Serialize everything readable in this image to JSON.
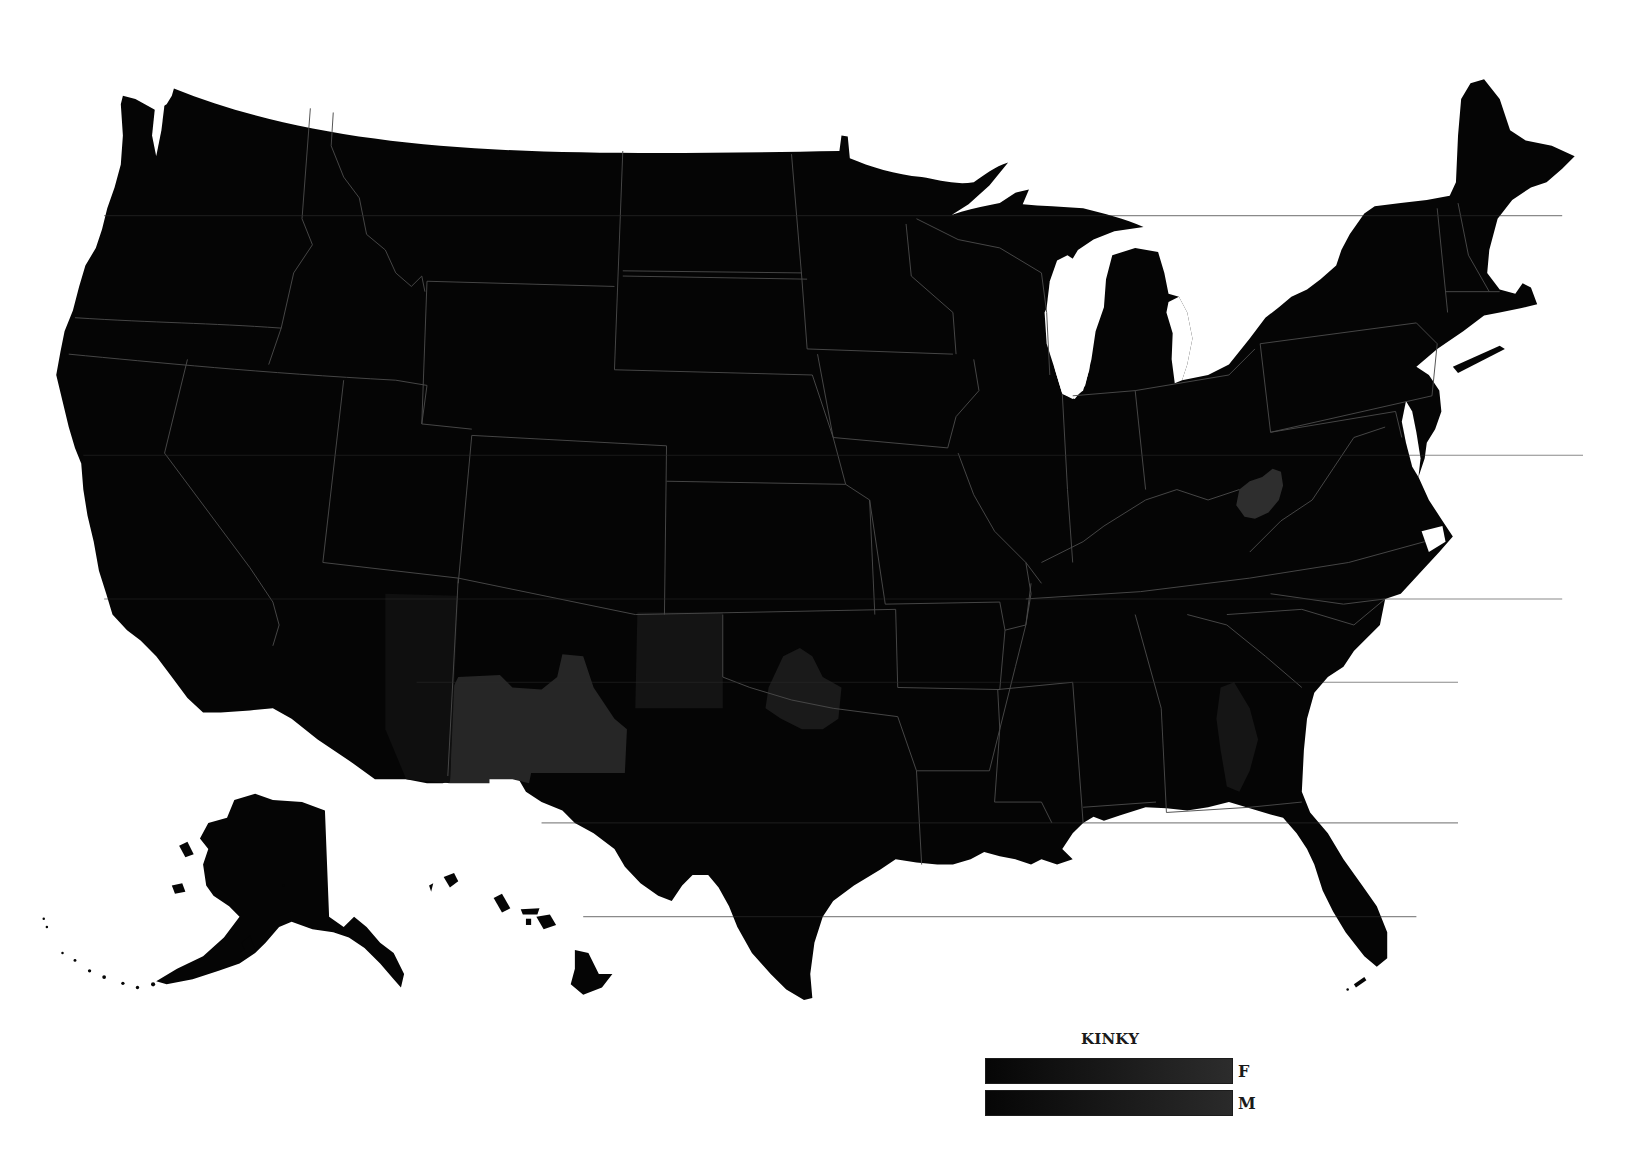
{
  "map": {
    "type": "choropleth",
    "subject": "United States by county",
    "background_color": "#ffffff",
    "base_fill_color": "#050505",
    "border_color": "#4a4a4a",
    "highlight_regions": [
      {
        "name": "New Mexico (central/south)",
        "fill": "#262626"
      },
      {
        "name": "West Virginia (south)",
        "fill": "#2e2e2e"
      },
      {
        "name": "Texas Panhandle",
        "fill": "#141414"
      },
      {
        "name": "Oklahoma (central-south)",
        "fill": "#1a1a1a"
      },
      {
        "name": "Georgia (central)",
        "fill": "#151515"
      },
      {
        "name": "Arizona (east)",
        "fill": "#101010"
      }
    ],
    "insets": [
      "Alaska",
      "Hawaii"
    ]
  },
  "legend": {
    "title": "KINKY",
    "rows": [
      {
        "label": "F",
        "gradient_start": "#060606",
        "gradient_end": "#2c2c2c"
      },
      {
        "label": "M",
        "gradient_start": "#060606",
        "gradient_end": "#2a2a2a"
      }
    ]
  }
}
